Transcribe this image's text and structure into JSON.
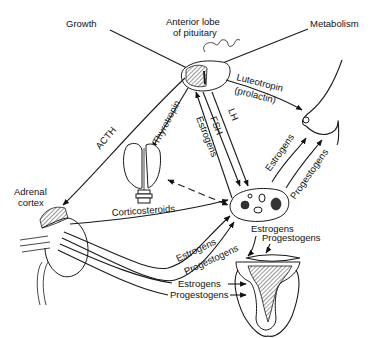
{
  "diagram": {
    "type": "endocrine-flow-diagram",
    "nodes": {
      "pituitary": {
        "label_line1": "Anterior lobe",
        "label_line2": "of pituitary"
      },
      "growth": {
        "label": "Growth"
      },
      "metabolism": {
        "label": "Metabolism"
      },
      "adrenal": {
        "label_line1": "Adrenal",
        "label_line2": "cortex"
      },
      "thyroid": {
        "label": ""
      },
      "breast": {
        "label": ""
      },
      "ovary": {
        "label": ""
      },
      "uterus": {
        "label": ""
      }
    },
    "edges": [
      {
        "from": "pituitary",
        "to": "adrenal",
        "label": "ACTH"
      },
      {
        "from": "pituitary",
        "to": "thyroid",
        "label": "Thyrotropin"
      },
      {
        "from": "pituitary",
        "to": "breast",
        "label_line1": "Luteotropin",
        "label_line2": "(prolactin)"
      },
      {
        "from": "pituitary",
        "to": "ovary",
        "label": "FSH"
      },
      {
        "from": "pituitary",
        "to": "ovary",
        "label": "LH"
      },
      {
        "from": "ovary",
        "to": "pituitary",
        "label": "Estrogens"
      },
      {
        "from": "ovary",
        "to": "breast",
        "label": "Estrogens"
      },
      {
        "from": "ovary",
        "to": "breast",
        "label": "Progestogens"
      },
      {
        "from": "adrenal",
        "to": "ovary",
        "label": "Corticosteroids"
      },
      {
        "from": "adrenal",
        "to": "ovary",
        "label": "Estrogens"
      },
      {
        "from": "adrenal",
        "to": "ovary",
        "label": "Progestogens"
      },
      {
        "from": "adrenal",
        "to": "uterus",
        "label": "Estrogens"
      },
      {
        "from": "adrenal",
        "to": "uterus",
        "label": "Progestogens"
      },
      {
        "from": "ovary",
        "to": "uterus",
        "label": "Estrogens"
      },
      {
        "from": "ovary",
        "to": "uterus",
        "label": "Progestogens"
      },
      {
        "from": "thyroid",
        "to": "ovary",
        "label": "",
        "style": "dashed-bidirectional"
      },
      {
        "from": "pituitary",
        "to": "growth",
        "label": ""
      },
      {
        "from": "pituitary",
        "to": "metabolism",
        "label": ""
      }
    ]
  }
}
